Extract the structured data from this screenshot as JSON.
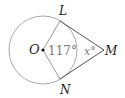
{
  "diagram": {
    "points": {
      "O": "O",
      "L": "L",
      "M": "M",
      "N": "N"
    },
    "angles": {
      "central": "117°",
      "at_M": "x°"
    },
    "colors": {
      "circle": "#999999",
      "tangent": "#555555",
      "radius": "#888888"
    }
  }
}
